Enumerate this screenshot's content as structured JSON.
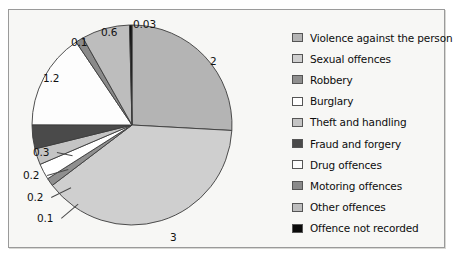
{
  "chart_data": {
    "type": "pie",
    "title": "",
    "xlabel": "",
    "ylabel": "",
    "legend_position": "right",
    "grid": false,
    "categories": [
      "Violence against the person",
      "Sexual offences",
      "Robbery",
      "Burglary",
      "Theft and handling",
      "Fraud and forgery",
      "Drug offences",
      "Motoring offences",
      "Other offences",
      "Offence not recorded"
    ],
    "values": [
      2,
      3,
      0.1,
      0.2,
      0.2,
      0.3,
      1.2,
      0.1,
      0.6,
      0.03
    ],
    "value_labels": [
      "2",
      "3",
      "0.1",
      "0.2",
      "0.2",
      "0.3",
      "1.2",
      "0.1",
      "0.6",
      "0.03"
    ],
    "colors": [
      "#b4b4b4",
      "#cfcfcf",
      "#8f8f8f",
      "#ffffff",
      "#c4c4c4",
      "#4a4a4a",
      "#fdfdfd",
      "#8a8a8a",
      "#bdbdbd",
      "#0a0a0a"
    ]
  },
  "legend": {
    "items": [
      {
        "label": "Violence against the person",
        "color": "#b4b4b4"
      },
      {
        "label": "Sexual offences",
        "color": "#cfcfcf"
      },
      {
        "label": "Robbery",
        "color": "#8f8f8f"
      },
      {
        "label": "Burglary",
        "color": "#ffffff"
      },
      {
        "label": "Theft and handling",
        "color": "#c4c4c4"
      },
      {
        "label": "Fraud and forgery",
        "color": "#4a4a4a"
      },
      {
        "label": "Drug offences",
        "color": "#fdfdfd"
      },
      {
        "label": "Motoring offences",
        "color": "#8a8a8a"
      },
      {
        "label": "Other offences",
        "color": "#bdbdbd"
      },
      {
        "label": "Offence not recorded",
        "color": "#0a0a0a"
      }
    ]
  },
  "pie_labels": [
    {
      "text": "0.03",
      "left": 124,
      "top": 8
    },
    {
      "text": "0.6",
      "left": 92,
      "top": 16
    },
    {
      "text": "0.1",
      "left": 62,
      "top": 26
    },
    {
      "text": "1.2",
      "left": 34,
      "top": 62
    },
    {
      "text": "0.3",
      "left": 24,
      "top": 136
    },
    {
      "text": "0.2",
      "left": 14,
      "top": 159
    },
    {
      "text": "0.2",
      "left": 18,
      "top": 181
    },
    {
      "text": "0.1",
      "left": 28,
      "top": 202
    },
    {
      "text": "2",
      "left": 201,
      "top": 45
    },
    {
      "text": "3",
      "left": 161,
      "top": 221
    }
  ]
}
